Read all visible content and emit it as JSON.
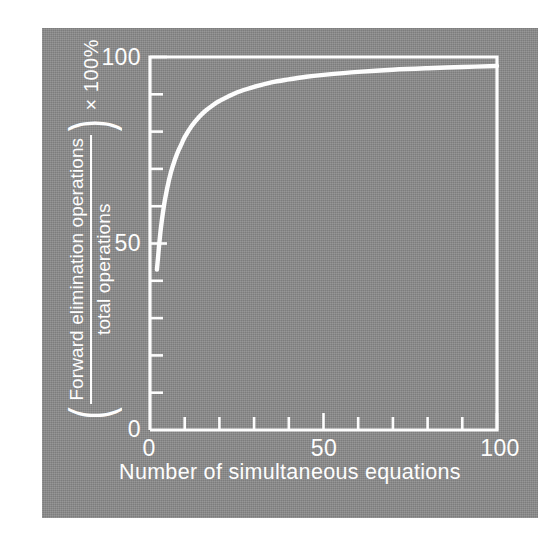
{
  "figure": {
    "background_color": "#8b8b8b",
    "ink_color": "#fdfdfd",
    "page_color": "#ffffff"
  },
  "axes": {
    "x": {
      "title": "Number of simultaneous equations",
      "labels": [
        "0",
        "50",
        "100"
      ],
      "label_values": [
        0,
        50,
        100
      ],
      "tick_values": [
        0,
        10,
        20,
        30,
        40,
        50,
        60,
        70,
        80,
        90,
        100
      ],
      "min": 0,
      "max": 100
    },
    "y": {
      "title_open_paren": "(",
      "title_numerator": "Forward elimination operations",
      "title_denominator": "total operations",
      "title_close_paren": ")",
      "title_multiplier": "× 100%",
      "labels": [
        "0",
        "50",
        "100"
      ],
      "label_values": [
        0,
        50,
        100
      ],
      "tick_values": [
        0,
        10,
        20,
        30,
        40,
        50,
        60,
        70,
        80,
        90,
        100
      ],
      "min": 0,
      "max": 100
    }
  },
  "chart_data": {
    "type": "line",
    "title": "",
    "subtitle": "",
    "xlabel": "Number of simultaneous equations",
    "ylabel": "(Forward elimination operations / total operations) × 100%",
    "xlim": [
      0,
      100
    ],
    "ylim": [
      0,
      100
    ],
    "xticks": [
      0,
      10,
      20,
      30,
      40,
      50,
      60,
      70,
      80,
      90,
      100
    ],
    "xticklabels": [
      "0",
      "",
      "",
      "",
      "",
      "50",
      "",
      "",
      "",
      "",
      "100"
    ],
    "yticks": [
      0,
      10,
      20,
      30,
      40,
      50,
      60,
      70,
      80,
      90,
      100
    ],
    "yticklabels": [
      "0",
      "",
      "",
      "",
      "",
      "50",
      "",
      "",
      "",
      "",
      "100"
    ],
    "grid": false,
    "legend": false,
    "legend_position": "none",
    "line_color": "#fdfdfd",
    "series": [
      {
        "name": "Forward elimination percentage",
        "x": [
          2,
          3,
          4,
          5,
          6,
          7,
          8,
          9,
          10,
          12,
          14,
          16,
          18,
          20,
          25,
          30,
          35,
          40,
          45,
          50,
          60,
          70,
          80,
          90,
          100
        ],
        "values": [
          43.0,
          53.0,
          60.0,
          65.0,
          69.0,
          72.0,
          74.5,
          76.5,
          78.5,
          81.5,
          83.8,
          85.6,
          87.0,
          88.2,
          90.5,
          92.0,
          93.2,
          94.0,
          94.7,
          95.2,
          96.0,
          96.6,
          97.0,
          97.3,
          97.6
        ]
      }
    ],
    "annotations": []
  }
}
